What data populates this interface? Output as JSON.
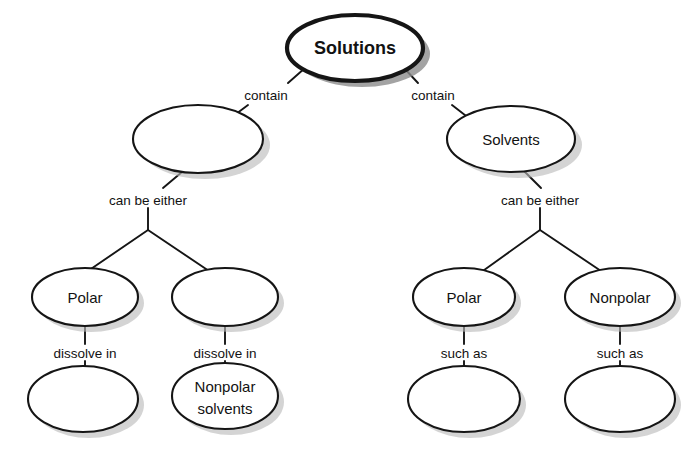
{
  "diagram": {
    "type": "concept-map",
    "background_color": "#ffffff",
    "stroke_color": "#151515",
    "text_color": "#121212",
    "shadow_color": "#b9b9b9",
    "nodes": [
      {
        "id": "root",
        "label": "Solutions",
        "blank": false,
        "emphasis": "bold",
        "cx": 355,
        "cy": 48,
        "rx": 68,
        "ry": 33
      },
      {
        "id": "l2-left",
        "label": "",
        "blank": true,
        "emphasis": "normal",
        "cx": 198,
        "cy": 139,
        "rx": 65,
        "ry": 34
      },
      {
        "id": "l2-right",
        "label": "Solvents",
        "blank": false,
        "emphasis": "normal",
        "cx": 511,
        "cy": 139,
        "rx": 64,
        "ry": 33
      },
      {
        "id": "l3-left-a",
        "label": "Polar",
        "blank": false,
        "emphasis": "normal",
        "cx": 85,
        "cy": 297,
        "rx": 53,
        "ry": 29
      },
      {
        "id": "l3-left-b",
        "label": "",
        "blank": true,
        "emphasis": "normal",
        "cx": 225,
        "cy": 297,
        "rx": 53,
        "ry": 29
      },
      {
        "id": "l3-right-a",
        "label": "Polar",
        "blank": false,
        "emphasis": "normal",
        "cx": 464,
        "cy": 297,
        "rx": 51,
        "ry": 29
      },
      {
        "id": "l3-right-b",
        "label": "Nonpolar",
        "blank": false,
        "emphasis": "normal",
        "cx": 620,
        "cy": 297,
        "rx": 55,
        "ry": 29
      },
      {
        "id": "l4-left-a",
        "label": "",
        "blank": true,
        "emphasis": "normal",
        "cx": 83,
        "cy": 399,
        "rx": 55,
        "ry": 33
      },
      {
        "id": "l4-left-b",
        "label": "Nonpolar solvents",
        "label_lines": [
          "Nonpolar",
          "solvents"
        ],
        "blank": false,
        "emphasis": "normal",
        "cx": 225,
        "cy": 396,
        "rx": 53,
        "ry": 33
      },
      {
        "id": "l4-right-a",
        "label": "",
        "blank": true,
        "emphasis": "normal",
        "cx": 464,
        "cy": 399,
        "rx": 56,
        "ry": 33
      },
      {
        "id": "l4-right-b",
        "label": "",
        "blank": true,
        "emphasis": "normal",
        "cx": 620,
        "cy": 399,
        "rx": 55,
        "ry": 33
      }
    ],
    "edge_labels": [
      {
        "id": "contain-left",
        "text": "contain",
        "x": 266,
        "y": 95
      },
      {
        "id": "contain-right",
        "text": "contain",
        "x": 433,
        "y": 95
      },
      {
        "id": "either-left",
        "text": "can be either",
        "x": 148,
        "y": 200
      },
      {
        "id": "either-right",
        "text": "can be either",
        "x": 540,
        "y": 200
      },
      {
        "id": "dissolve-left",
        "text": "dissolve in",
        "x": 85,
        "y": 355
      },
      {
        "id": "dissolve-right",
        "text": "dissolve in",
        "x": 225,
        "y": 355
      },
      {
        "id": "suchas-left",
        "text": "such as",
        "x": 464,
        "y": 355
      },
      {
        "id": "suchas-right",
        "text": "such as",
        "x": 620,
        "y": 355
      }
    ]
  }
}
